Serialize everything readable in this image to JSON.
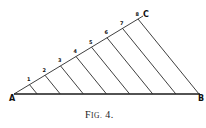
{
  "figure": {
    "caption": "Fig. 4.",
    "points": {
      "A": "A",
      "B": "B",
      "C": "C"
    },
    "division_labels": [
      "1",
      "2",
      "3",
      "4",
      "5",
      "6",
      "7",
      "8"
    ]
  }
}
